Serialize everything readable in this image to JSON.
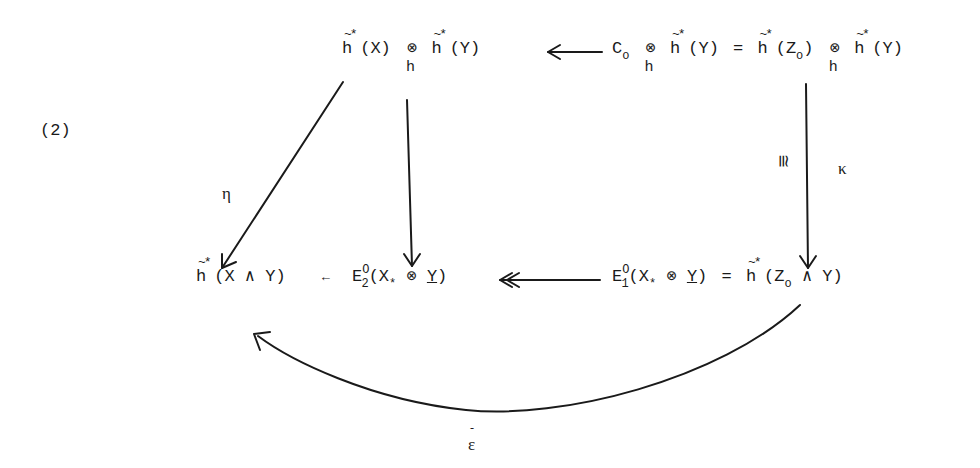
{
  "equation_label": "(2)",
  "nodes": {
    "top_left": {
      "text": "h̃*(X) ⊗_h h̃*(Y)",
      "h1": "h",
      "arg1": "(X)",
      "tensor": "⊗",
      "tensor_sub": "h",
      "h2": "h",
      "arg2": "(Y)",
      "accent": "~*"
    },
    "top_right": {
      "text": "C₀ ⊗_h h̃*(Y) = h̃*(Z₀) ⊗_h h̃*(Y)",
      "c": "C",
      "c_sub": "o",
      "tensor": "⊗",
      "tensor_sub": "h",
      "h": "h",
      "arg_y": "(Y)",
      "eq": "=",
      "arg_z": "(Z",
      "z_sub": "o",
      "close": ")",
      "accent": "~*"
    },
    "bottom_left": {
      "text": "h̃*(X ∧ Y)",
      "h": "h",
      "arg": "(X ∧ Y)",
      "accent": "~*"
    },
    "bottom_middle": {
      "text": "E₂⁰(X* ⊗ Y)",
      "arrow_in": "←",
      "e": "E",
      "e_sub": "2",
      "e_sup": "O",
      "open": "(X",
      "x_sub": "*",
      "tensor": "⊗",
      "y": "Y",
      "close": ")"
    },
    "bottom_right": {
      "text": "E₁⁰(X* ⊗ Y) = h̃*(Z₀ ∧ Y)",
      "e": "E",
      "e_sub": "1",
      "e_sup": "O",
      "open": "(X",
      "x_sub": "*",
      "tensor": "⊗",
      "y": "Y",
      "close": ")",
      "eq": "=",
      "h": "h",
      "arg_z": "(Z",
      "z_sub": "o",
      "rest": "∧ Y)",
      "accent": "~*"
    }
  },
  "arrows": [
    {
      "from": "top_right",
      "to": "top_left",
      "label": "",
      "style": "single"
    },
    {
      "from": "top_left",
      "to": "bottom_left",
      "label": "η",
      "style": "single"
    },
    {
      "from": "top_left",
      "to": "bottom_middle",
      "label": "",
      "style": "single"
    },
    {
      "from": "top_right",
      "to": "bottom_right",
      "label": "κ",
      "iso_label": "≅",
      "style": "single"
    },
    {
      "from": "bottom_right",
      "to": "bottom_middle",
      "label": "",
      "style": "double-head"
    },
    {
      "from": "bottom_right",
      "to": "bottom_left",
      "label": "ε̄",
      "style": "curved"
    }
  ],
  "labels": {
    "eta": "η",
    "kappa": "κ",
    "iso": "≅",
    "epsilon_bar": "ε",
    "epsilon_bar_mark": "-"
  }
}
